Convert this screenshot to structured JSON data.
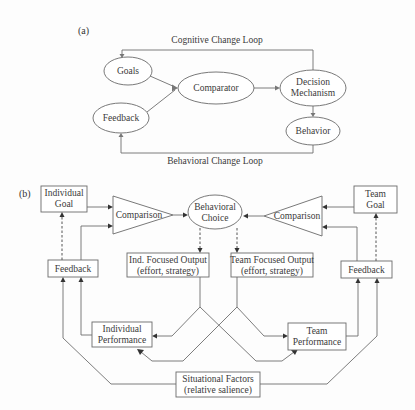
{
  "panel_a": {
    "label": "(a)",
    "cognitive_loop_label": "Cognitive Change Loop",
    "behavioral_loop_label": "Behavioral Change Loop",
    "nodes": {
      "goals": "Goals",
      "feedback": "Feedback",
      "comparator": "Comparator",
      "decision_line1": "Decision",
      "decision_line2": "Mechanism",
      "behavior": "Behavior"
    }
  },
  "panel_b": {
    "label": "(b)",
    "individual_goal_line1": "Individual",
    "individual_goal_line2": "Goal",
    "team_goal_line1": "Team",
    "team_goal_line2": "Goal",
    "comparison_left": "Comparison",
    "comparison_right": "Comparison",
    "behavioral_choice_line1": "Behavioral",
    "behavioral_choice_line2": "Choice",
    "feedback_left": "Feedback",
    "feedback_right": "Feedback",
    "ind_output_line1": "Ind. Focused Output",
    "ind_output_line2": "(effort, strategy)",
    "team_output_line1": "Team Focused Output",
    "team_output_line2": "(effort, strategy)",
    "individual_performance_line1": "Individual",
    "individual_performance_line2": "Performance",
    "team_performance_line1": "Team",
    "team_performance_line2": "Performance",
    "situational_line1": "Situational Factors",
    "situational_line2": "(relative salience)"
  }
}
